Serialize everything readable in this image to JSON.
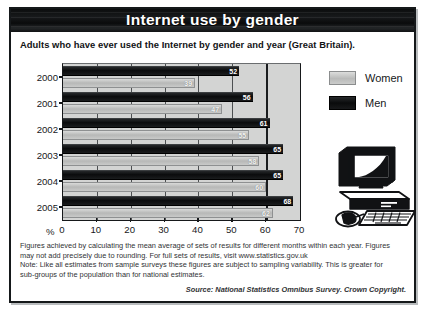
{
  "figure": {
    "title": "Internet use by gender",
    "subtitle": "Adults who have ever used the Internet by gender and year (Great Britain)."
  },
  "legend": {
    "items": [
      {
        "label": "Women",
        "color": "#c5c6c5"
      },
      {
        "label": "Men",
        "color": "#111214"
      }
    ]
  },
  "axis": {
    "percent_symbol": "%",
    "ticks": [
      "0",
      "10",
      "20",
      "30",
      "40",
      "50",
      "60",
      "70"
    ]
  },
  "footnotes": {
    "line1": "Figures achieved by calculating the mean average of sets of results for different months within each year. Figures",
    "line2": "may not add precisely due to rounding. For full sets of results, visit www.statistics.gov.uk",
    "line3": "Note: Like all estimates from sample surveys these figures are subject to sampling variability. This is greater for",
    "line4": "sub-groups of the population than for national estimates.",
    "source": "Source: National Statistics Omnibus Survey. Crown Copyright."
  },
  "illustration": {
    "name": "desktop-computer"
  },
  "chart_data": {
    "type": "bar",
    "orientation": "horizontal",
    "title": "Internet use by gender",
    "subtitle": "Adults who have ever used the Internet by gender and year (Great Britain).",
    "xlabel": "%",
    "ylabel": "",
    "xlim": [
      0,
      70
    ],
    "xticks": [
      0,
      10,
      20,
      30,
      40,
      50,
      60,
      70
    ],
    "grid": true,
    "legend_position": "right",
    "categories": [
      "2000",
      "2001",
      "2002",
      "2003",
      "2004",
      "2005"
    ],
    "series": [
      {
        "name": "Men",
        "color": "#111214",
        "values": [
          52,
          56,
          61,
          65,
          65,
          68
        ]
      },
      {
        "name": "Women",
        "color": "#c5c6c5",
        "values": [
          39,
          47,
          55,
          58,
          60,
          62
        ]
      }
    ]
  }
}
